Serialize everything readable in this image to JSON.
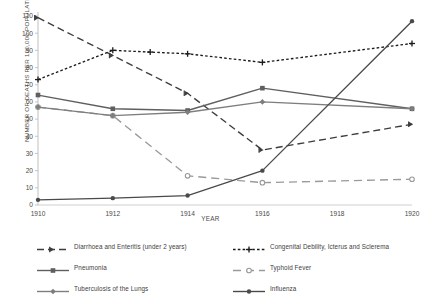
{
  "chart_data": {
    "type": "line",
    "title": "",
    "xlabel": "YEAR",
    "ylabel": "NUMBER OF DEATHS PER 100,000 POPULATION",
    "x": [
      1910,
      1911,
      1912,
      1913,
      1914,
      1915,
      1916,
      1917,
      1918,
      1919,
      1920
    ],
    "xticks": [
      "1910",
      "1912",
      "1914",
      "1916",
      "1918",
      "1920"
    ],
    "xtick_values": [
      1910,
      1912,
      1914,
      1916,
      1918,
      1920
    ],
    "yticks": [
      "0",
      "10",
      "20",
      "30",
      "40",
      "50",
      "60",
      "70",
      "80",
      "90",
      "100",
      "110"
    ],
    "ytick_values": [
      0,
      10,
      20,
      30,
      40,
      50,
      60,
      70,
      80,
      90,
      100,
      110
    ],
    "xlim": [
      1910,
      1920
    ],
    "ylim": [
      0,
      110
    ],
    "grid": false,
    "legend_position": "bottom",
    "series": [
      {
        "name": "Diarrhoea and Enteritis (under 2 years)",
        "color": "#3d3d3d",
        "style": "dashed",
        "marker": "arrow",
        "x": [
          1910,
          1912,
          1914,
          1916,
          1920
        ],
        "values": [
          109,
          87,
          65,
          32,
          47
        ]
      },
      {
        "name": "Congenital Debility, Icterus and Sclerema",
        "color": "#1a1a1a",
        "style": "dotted",
        "marker": "plus",
        "x": [
          1910,
          1912,
          1913,
          1914,
          1916,
          1920
        ],
        "values": [
          73,
          90,
          89,
          88,
          83,
          94
        ]
      },
      {
        "name": "Pneumonia",
        "color": "#5f5f5f",
        "style": "solid",
        "marker": "square",
        "x": [
          1910,
          1912,
          1914,
          1916,
          1920
        ],
        "values": [
          64,
          56,
          55,
          68,
          56
        ]
      },
      {
        "name": "Typhoid Fever",
        "color": "#9a9a9a",
        "style": "longdash",
        "marker": "circle-open",
        "x": [
          1910,
          1912,
          1914,
          1916,
          1920
        ],
        "values": [
          57,
          52,
          17,
          13,
          15
        ]
      },
      {
        "name": "Tuberculosis of the Lungs",
        "color": "#7e7e7e",
        "style": "solid",
        "marker": "diamond",
        "x": [
          1910,
          1912,
          1914,
          1916,
          1920
        ],
        "values": [
          57,
          52,
          54,
          60,
          56
        ]
      },
      {
        "name": "Influenza",
        "color": "#4a4a4a",
        "style": "solid",
        "marker": "circle",
        "x": [
          1910,
          1912,
          1914,
          1916,
          1920
        ],
        "values": [
          3,
          4,
          5.5,
          20,
          107
        ]
      }
    ]
  },
  "legend": {
    "left_items": [
      "Diarrhoea and Enteritis (under 2 years)",
      "Pneumonia",
      "Tuberculosis of the Lungs"
    ],
    "right_items": [
      "Congenital Debility, Icterus and Sclerema",
      "Typhoid Fever",
      "Influenza"
    ]
  }
}
